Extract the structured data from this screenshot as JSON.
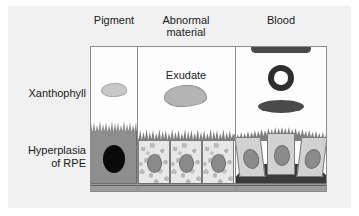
{
  "figure": {
    "background_color": "#f1f1f1",
    "box_color": "#fdfdfd",
    "border_color": "#8d8d8d"
  },
  "columns": [
    {
      "id": "pigment",
      "header": "Pigment",
      "xanthophyll_feature": "pale lobed pigment blob",
      "rpe_feature": "single large hyperplastic pigmented RPE cell with black nucleus",
      "cell_fill": "#8e8e8e",
      "nucleus_fill": "#0a0a0a"
    },
    {
      "id": "abnormal-material",
      "header": "Abnormal\nmaterial",
      "inline_label": "Exudate",
      "xanthophyll_feature": "gray exudate blob",
      "rpe_feature": "three RPE cells with granular vacuolated cytoplasm",
      "cell_fill": "#e8e8e8",
      "nucleus_fill": "#8b8b8b"
    },
    {
      "id": "blood",
      "header": "Blood",
      "xanthophyll_feature": "preretinal band, ring haemorrhage and dot haemorrhage",
      "rpe_feature": "three RPE cells elevated over sub-RPE blood mound",
      "cell_fill": "#d2d2d2",
      "nucleus_fill": "#8b8b8b",
      "blood_fill": "#3a3a3a"
    }
  ],
  "row_labels": [
    {
      "id": "xanthophyll",
      "text": "Xanthophyll"
    },
    {
      "id": "hyperplasia",
      "text": "Hyperplasia\nof RPE"
    }
  ],
  "structures": {
    "bruch_membrane": "Bruch's membrane basal band",
    "microvilli": "apical microvilli brush border"
  }
}
